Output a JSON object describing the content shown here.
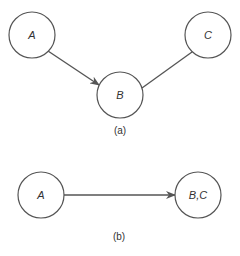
{
  "diagram_a": {
    "caption": "(a)",
    "nodes": [
      {
        "id": "A",
        "label": "A",
        "cx": 32,
        "cy": 35,
        "r": 23
      },
      {
        "id": "B",
        "label": "B",
        "cx": 120,
        "cy": 95,
        "r": 23
      },
      {
        "id": "C",
        "label": "C",
        "cx": 208,
        "cy": 35,
        "r": 23
      }
    ],
    "edges": [
      {
        "from": "A",
        "to": "B",
        "directed": true
      },
      {
        "from": "C",
        "to": "B",
        "directed": false
      }
    ]
  },
  "diagram_b": {
    "caption": "(b)",
    "nodes": [
      {
        "id": "A",
        "label": "A",
        "cx": 41,
        "cy": 195,
        "r": 23
      },
      {
        "id": "BC",
        "label": "B,C",
        "cx": 198,
        "cy": 195,
        "r": 23
      }
    ],
    "edges": [
      {
        "from": "A",
        "to": "BC",
        "directed": true
      }
    ]
  },
  "colors": {
    "stroke": "#555555",
    "text": "#333333",
    "background": "#ffffff"
  }
}
